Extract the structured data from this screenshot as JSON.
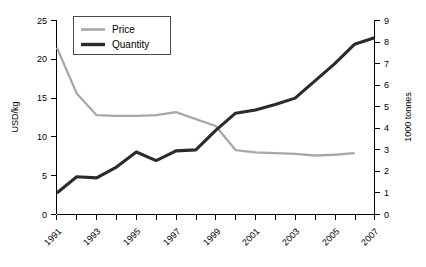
{
  "chart_data": {
    "type": "line",
    "title": "",
    "subtitle": "",
    "xlabel": "",
    "ylabel": "USD/kg",
    "y2label": "1000 tonnes",
    "grid": false,
    "legend_position": "top-left-inside",
    "x": [
      1991,
      1992,
      1993,
      1994,
      1995,
      1996,
      1997,
      1998,
      1999,
      2000,
      2001,
      2002,
      2003,
      2004,
      2005,
      2006,
      2007
    ],
    "xtick_labels": [
      "1991",
      "1993",
      "1995",
      "1997",
      "1999",
      "2001",
      "2003",
      "2005",
      "2007"
    ],
    "xtick_values": [
      1991,
      1993,
      1995,
      1997,
      1999,
      2001,
      2003,
      2005,
      2007
    ],
    "xlim": [
      1991,
      2007
    ],
    "ylim": [
      0,
      25
    ],
    "ytick_values": [
      0,
      5,
      10,
      15,
      20,
      25
    ],
    "ytick_labels": [
      "0",
      "5",
      "10",
      "15",
      "20",
      "25"
    ],
    "y2lim": [
      0,
      9
    ],
    "y2tick_values": [
      0,
      1,
      2,
      3,
      4,
      5,
      6,
      7,
      8,
      9
    ],
    "y2tick_labels": [
      "0",
      "1",
      "2",
      "3",
      "4",
      "5",
      "6",
      "7",
      "8",
      "9"
    ],
    "series": [
      {
        "name": "Price",
        "axis": "left",
        "unit": "USD/kg",
        "color": "#a8a8a8",
        "x": [
          1991,
          1992,
          1993,
          1994,
          1995,
          1996,
          1997,
          1998,
          1999,
          2000,
          2001,
          2002,
          2003,
          2004,
          2005,
          2006
        ],
        "values": [
          21.5,
          15.6,
          12.8,
          12.7,
          12.7,
          12.8,
          13.2,
          12.3,
          11.4,
          8.3,
          8.0,
          7.9,
          7.8,
          7.6,
          7.7,
          7.9
        ]
      },
      {
        "name": "Quantity",
        "axis": "right",
        "unit": "1000 tonnes",
        "color": "#2b2b2b",
        "x": [
          1991,
          1992,
          1993,
          1994,
          1995,
          1996,
          1997,
          1998,
          1999,
          2000,
          2001,
          2002,
          2003,
          2004,
          2005,
          2006,
          2007
        ],
        "values": [
          1.0,
          1.75,
          1.7,
          2.2,
          2.9,
          2.5,
          2.95,
          3.0,
          3.9,
          4.7,
          4.85,
          5.1,
          5.4,
          6.2,
          7.0,
          7.9,
          8.2
        ]
      }
    ],
    "legend": [
      "Price",
      "Quantity"
    ]
  }
}
